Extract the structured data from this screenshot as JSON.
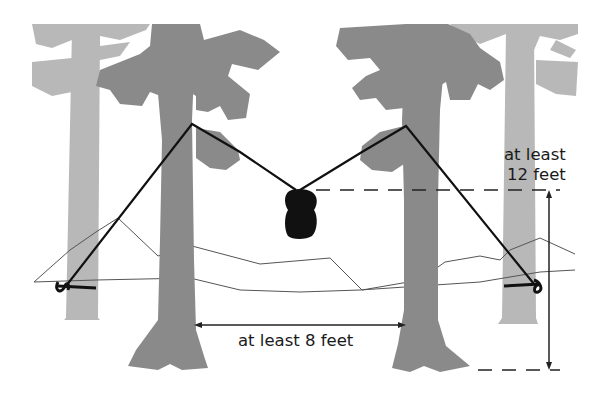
{
  "diagram": {
    "type": "bear-bag-hang",
    "labels": {
      "height_line1": "at least",
      "height_line2": "12 feet",
      "distance": "at least 8 feet"
    },
    "colors": {
      "background": "#ffffff",
      "foreground_trees": "#8a8a8a",
      "background_trees": "#b8b8b8",
      "rope": "#111111",
      "bag": "#111111",
      "mountains": "#555555",
      "dimension_lines": "#222222"
    },
    "elements": [
      "background-tree-left",
      "background-tree-right",
      "foreground-tree-left",
      "foreground-tree-right",
      "mountain-ridge",
      "rope-left",
      "rope-right",
      "food-bag",
      "height-dimension",
      "distance-dimension"
    ]
  }
}
